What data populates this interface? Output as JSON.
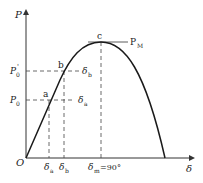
{
  "diagram": {
    "type": "power-angle-curve",
    "axes": {
      "y_label": "P",
      "x_label": "δ",
      "origin_label": "O"
    },
    "points": {
      "a": "a",
      "b": "b",
      "c": "c"
    },
    "y_levels": {
      "p0": "P",
      "p0_sub": "0",
      "p0_prime": "P",
      "p0_prime_sub": "0",
      "p0_prime_mark": "'",
      "pm": "P",
      "pm_sub": "M"
    },
    "right_labels": {
      "delta_a": "δ",
      "delta_a_sub": "a",
      "delta_b": "δ",
      "delta_b_sub": "b"
    },
    "x_ticks": {
      "delta_a": "δ",
      "delta_a_sub": "a",
      "delta_b": "δ",
      "delta_b_sub": "b",
      "delta_m": "δ",
      "delta_m_sub": "m",
      "delta_m_value": "=90°"
    },
    "colors": {
      "curve": "#1a1a1a",
      "axis": "#333333",
      "dashed": "#444444"
    }
  }
}
